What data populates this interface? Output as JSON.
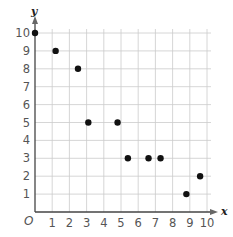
{
  "chart_data": {
    "type": "scatter",
    "title": "",
    "xlabel": "x",
    "ylabel": "y",
    "origin_label": "O",
    "xlim": [
      0,
      10
    ],
    "ylim": [
      0,
      10
    ],
    "grid": true,
    "x_ticks": [
      1,
      2,
      3,
      4,
      5,
      6,
      7,
      8,
      9,
      10
    ],
    "y_ticks": [
      1,
      2,
      3,
      4,
      5,
      6,
      7,
      8,
      9,
      10
    ],
    "points": [
      {
        "x": 0,
        "y": 10
      },
      {
        "x": 1.2,
        "y": 9
      },
      {
        "x": 2.5,
        "y": 8
      },
      {
        "x": 3.1,
        "y": 5
      },
      {
        "x": 4.8,
        "y": 5
      },
      {
        "x": 5.4,
        "y": 3
      },
      {
        "x": 6.6,
        "y": 3
      },
      {
        "x": 7.3,
        "y": 3
      },
      {
        "x": 8.8,
        "y": 1
      },
      {
        "x": 9.6,
        "y": 2
      }
    ],
    "colors": {
      "point": "#111111",
      "axis": "#444444",
      "grid": "#cccccc",
      "text": "#555555"
    }
  }
}
